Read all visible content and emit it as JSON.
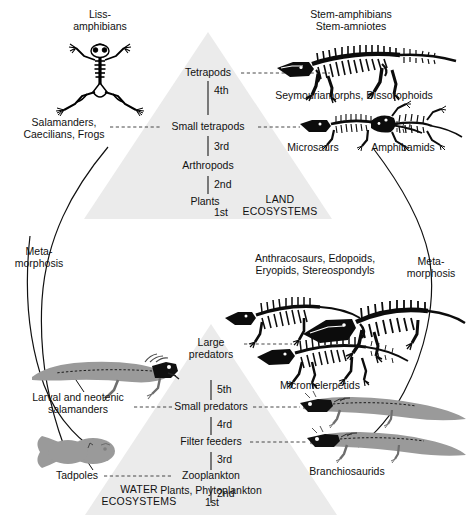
{
  "figure": {
    "type": "diagram"
  },
  "land_pyramid": {
    "eco_label_line1": "LAND",
    "eco_label_line2": "ECOSYSTEMS",
    "tiers": [
      {
        "name": "Tetrapods",
        "ordinal": "4th"
      },
      {
        "name": "Small tetrapods",
        "ordinal": "3rd"
      },
      {
        "name": "Arthropods",
        "ordinal": "2nd"
      },
      {
        "name": "Plants",
        "ordinal": "1st"
      }
    ]
  },
  "water_pyramid": {
    "eco_label_line1": "WATER",
    "eco_label_line2": "ECOSYSTEMS",
    "tiers": [
      {
        "name": "Large predators",
        "ordinal": "5th"
      },
      {
        "name": "Small predators",
        "ordinal": "4rd"
      },
      {
        "name": "Filter feeders",
        "ordinal": "3rd"
      },
      {
        "name": "Zooplankton",
        "ordinal": "2nd"
      },
      {
        "name": "Plants, Phytoplankton",
        "ordinal": "1st"
      }
    ]
  },
  "land_taxa": {
    "lissamphibians_line1": "Liss-",
    "lissamphibians_line2": "amphibians",
    "modern_line1": "Salamanders,",
    "modern_line2": "Caecilians, Frogs",
    "stem_line1": "Stem-amphibians",
    "stem_line2": "Stem-amniotes",
    "seymouriamorphs": "Seymouriamorphs, Dissorophoids",
    "microsaurs": "Microsaurs",
    "amphibamids": "Amphibamids"
  },
  "water_taxa": {
    "anthracosaurs_line1": "Anthracosaurs, Edopoids,",
    "anthracosaurs_line2": "Eryopids, Stereospondyls",
    "micromelerpetids": "Micromelerpetids",
    "branchiosaurids": "Branchiosaurids",
    "larval_line1": "Larval and neotenic",
    "larval_line2": "salamanders",
    "tadpoles": "Tadpoles"
  },
  "metamorphosis": {
    "left_line1": "Meta-",
    "left_line2": "morphosis",
    "right_line1": "Meta-",
    "right_line2": "morphosis"
  },
  "colors": {
    "background": "#ffffff",
    "pyramid_fill": "#ebebeb",
    "text": "#111111",
    "skeleton": "#000000",
    "soft_body": "#8e8e8e",
    "leader_line": "#333333"
  }
}
